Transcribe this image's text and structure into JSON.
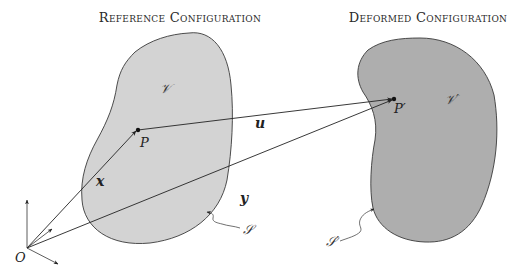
{
  "titles": {
    "reference": "Reference Configuration",
    "deformed": "Deformed Configuration"
  },
  "labels": {
    "volume_ref": "𝒱",
    "volume_def": "𝒱′",
    "point_ref": "P",
    "point_def": "P′",
    "displacement": "u",
    "position_ref": "x",
    "position_def": "y",
    "origin": "O",
    "surface_ref": "𝒮",
    "surface_def": "𝒮′"
  },
  "colors": {
    "reference_fill": "#d3d3d3",
    "deformed_fill": "#aeaeae",
    "outline": "#3a3a3a",
    "vector": "#222222"
  }
}
